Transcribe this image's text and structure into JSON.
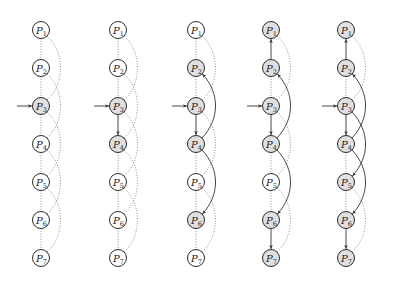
{
  "diagram": {
    "node_prefix": "P",
    "node_labels": [
      "1",
      "2",
      "3",
      "4",
      "5",
      "6",
      "7"
    ],
    "colors": {
      "shaded_fill": "#e0e0e0",
      "white_fill": "#ffffff",
      "stroke": "#2b2b2b"
    },
    "layout": {
      "panel_x": [
        41,
        118,
        196,
        271,
        346
      ],
      "top_y": 30,
      "spacing_y": 38,
      "radius": 8.5,
      "curve_offset": 20
    },
    "entry_node": 3,
    "panels": [
      {
        "id": "panel-1",
        "shaded": [
          3
        ],
        "solid_straight": [],
        "solid_curves": [],
        "dotted_straight": [
          [
            1,
            2
          ],
          [
            2,
            3
          ],
          [
            3,
            4
          ],
          [
            4,
            5
          ],
          [
            5,
            6
          ],
          [
            6,
            7
          ]
        ],
        "dotted_curves": [
          [
            1,
            3
          ],
          [
            2,
            4
          ],
          [
            3,
            5
          ],
          [
            4,
            6
          ],
          [
            5,
            7
          ]
        ]
      },
      {
        "id": "panel-2",
        "shaded": [
          3,
          4
        ],
        "solid_straight": [
          [
            3,
            4
          ]
        ],
        "solid_curves": [],
        "dotted_straight": [
          [
            1,
            2
          ],
          [
            2,
            3
          ],
          [
            4,
            5
          ],
          [
            5,
            6
          ],
          [
            6,
            7
          ]
        ],
        "dotted_curves": [
          [
            1,
            3
          ],
          [
            2,
            4
          ],
          [
            3,
            5
          ],
          [
            4,
            6
          ],
          [
            5,
            7
          ]
        ]
      },
      {
        "id": "panel-3",
        "shaded": [
          2,
          3,
          4,
          6
        ],
        "solid_straight": [
          [
            3,
            4
          ]
        ],
        "solid_curves": [
          [
            4,
            2
          ],
          [
            4,
            6
          ]
        ],
        "dotted_straight": [
          [
            1,
            2
          ],
          [
            2,
            3
          ],
          [
            4,
            5
          ],
          [
            5,
            6
          ],
          [
            6,
            7
          ]
        ],
        "dotted_curves": [
          [
            1,
            3
          ],
          [
            3,
            5
          ],
          [
            5,
            7
          ]
        ]
      },
      {
        "id": "panel-4",
        "shaded": [
          1,
          2,
          3,
          4,
          6,
          7
        ],
        "solid_straight": [
          [
            2,
            1
          ],
          [
            3,
            4
          ],
          [
            6,
            7
          ]
        ],
        "solid_curves": [
          [
            4,
            2
          ],
          [
            4,
            6
          ]
        ],
        "dotted_straight": [
          [
            2,
            3
          ],
          [
            4,
            5
          ],
          [
            5,
            6
          ]
        ],
        "dotted_curves": [
          [
            1,
            3
          ],
          [
            3,
            5
          ],
          [
            5,
            7
          ]
        ]
      },
      {
        "id": "panel-5",
        "shaded": [
          1,
          2,
          3,
          4,
          5,
          6,
          7
        ],
        "solid_straight": [
          [
            2,
            1
          ],
          [
            3,
            4
          ],
          [
            6,
            7
          ]
        ],
        "solid_curves": [
          [
            4,
            2
          ],
          [
            3,
            5
          ],
          [
            4,
            6
          ]
        ],
        "dotted_straight": [
          [
            2,
            3
          ],
          [
            4,
            5
          ],
          [
            5,
            6
          ]
        ],
        "dotted_curves": [
          [
            1,
            3
          ],
          [
            5,
            7
          ]
        ]
      }
    ]
  }
}
